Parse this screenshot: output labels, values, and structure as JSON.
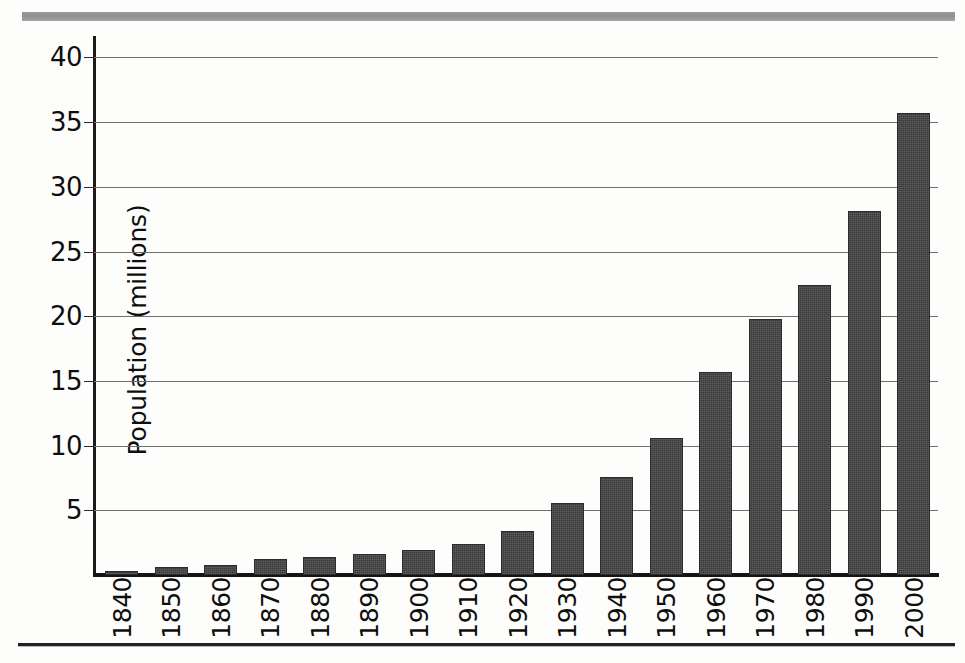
{
  "figure": {
    "top_rule_color": "#969696",
    "bottom_rule_color": "#222222",
    "background_color": "#fdfdfc"
  },
  "chart_data": {
    "type": "bar",
    "title": "",
    "subtitle": "",
    "xlabel": "",
    "ylabel": "Population (millions)",
    "categories": [
      "1840",
      "1850",
      "1860",
      "1870",
      "1880",
      "1890",
      "1900",
      "1910",
      "1920",
      "1930",
      "1940",
      "1950",
      "1960",
      "1970",
      "1980",
      "1990",
      "2000"
    ],
    "values": [
      0.3,
      0.6,
      0.8,
      1.2,
      1.4,
      1.6,
      1.9,
      2.4,
      3.4,
      5.6,
      7.6,
      10.6,
      15.7,
      19.8,
      22.4,
      28.1,
      35.7
    ],
    "ylim": [
      0,
      41.5
    ],
    "yticks": [
      5,
      10,
      15,
      20,
      25,
      30,
      35,
      40
    ],
    "ytick_labels": [
      "5",
      "10",
      "15",
      "20",
      "25",
      "30",
      "35",
      "40"
    ],
    "grid": true,
    "grid_axis": "y",
    "legend": false,
    "legend_position": "none",
    "bar_color": "#393939",
    "axis_color": "#151515",
    "gridline_color": "#6f6f6f",
    "xtick_rotation": -90
  }
}
